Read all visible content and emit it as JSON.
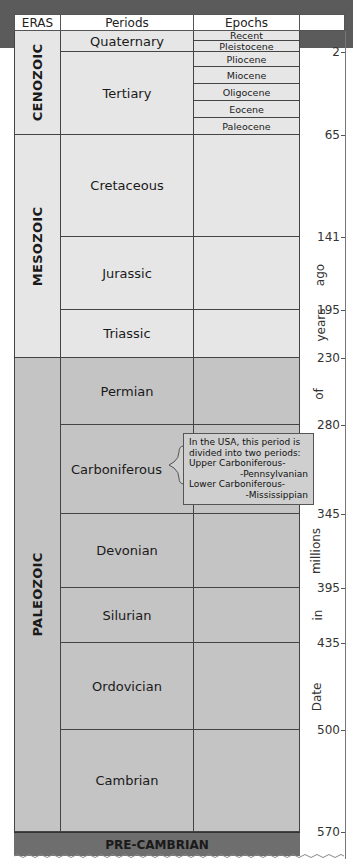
{
  "header": {
    "eras": "ERAS",
    "periods": "Periods",
    "epochs": "Epochs"
  },
  "eras": [
    {
      "name": "CENOZOIC"
    },
    {
      "name": "MESOZOIC"
    },
    {
      "name": "PALEOZOIC"
    }
  ],
  "periods": [
    {
      "name": "Quaternary"
    },
    {
      "name": "Tertiary"
    },
    {
      "name": "Cretaceous"
    },
    {
      "name": "Jurassic"
    },
    {
      "name": "Triassic"
    },
    {
      "name": "Permian"
    },
    {
      "name": "Carboniferous"
    },
    {
      "name": "Devonian"
    },
    {
      "name": "Silurian"
    },
    {
      "name": "Ordovician"
    },
    {
      "name": "Cambrian"
    }
  ],
  "epochs": [
    "Recent",
    "Pleistocene",
    "Pliocene",
    "Miocene",
    "Oligocene",
    "Eocene",
    "Paleocene"
  ],
  "precambrian": "PRE-CAMBRIAN",
  "scale": {
    "ticks": [
      "2",
      "65",
      "141",
      "195",
      "230",
      "280",
      "345",
      "395",
      "435",
      "500",
      "570"
    ],
    "axis_words": [
      "Date",
      "in",
      "millions",
      "of",
      "years",
      "ago"
    ]
  },
  "callout": {
    "line1": "In the USA, this period is",
    "line2": "divided into two periods:",
    "line3": "Upper Carboniferous-",
    "line4": "-Pennsylvanian",
    "line5": "Lower Carboniferous-",
    "line6": "-Mississippian"
  },
  "colors": {
    "cenozoic_mesozoic_bg": "#e6e6e6",
    "paleozoic_bg": "#c4c4c4",
    "precambrian_bg": "#6e6e6e",
    "top_band": "#5b5b5b"
  }
}
